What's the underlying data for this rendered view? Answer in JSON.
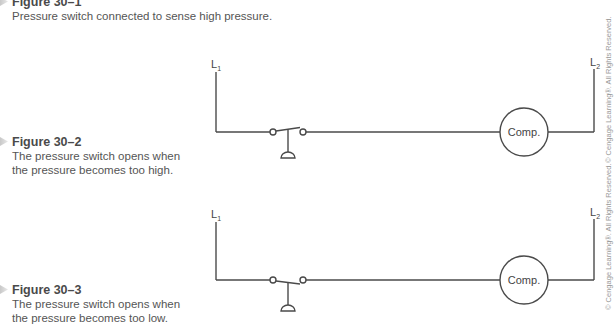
{
  "figures": [
    {
      "id": "30-1",
      "title": "Figure 30–1",
      "caption": "Pressure switch connected to sense high pressure."
    },
    {
      "id": "30-2",
      "title": "Figure 30–2",
      "caption_line1": "The pressure switch opens when",
      "caption_line2": "the pressure becomes too high.",
      "diagram": {
        "left_line_label": "L",
        "left_line_sub": "1",
        "right_line_label": "L",
        "right_line_sub": "2",
        "load_label": "Comp.",
        "switch_state": "blade tilted up (opens on high pressure)"
      }
    },
    {
      "id": "30-3",
      "title": "Figure 30–3",
      "caption_line1": "The pressure switch opens when",
      "caption_line2": "the pressure becomes too low.",
      "diagram": {
        "left_line_label": "L",
        "left_line_sub": "1",
        "right_line_label": "L",
        "right_line_sub": "2",
        "load_label": "Comp.",
        "switch_state": "blade tilted down (opens on low pressure)"
      }
    }
  ],
  "copyright": "© Cengage Learning®. All Rights Reserved.",
  "colors": {
    "line": "#4a4a4a",
    "caption_text": "#555555",
    "copyright_text": "#9a9a9a"
  }
}
